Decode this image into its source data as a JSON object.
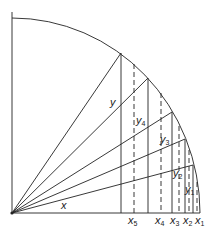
{
  "diagram": {
    "labels": {
      "x": "x",
      "y": "y",
      "y4": "y",
      "y4_sub": "4",
      "y3": "y",
      "y3_sub": "3",
      "y2": "y",
      "y2_sub": "2",
      "y1": "y",
      "y1_sub": "1",
      "x5": "x",
      "x5_sub": "5",
      "x4": "x",
      "x4_sub": "4",
      "x3": "x",
      "x3_sub": "3",
      "x2": "x",
      "x2_sub": "2",
      "x1": "x",
      "x1_sub": "1"
    },
    "colors": {
      "stroke": "#222222",
      "background": "#ffffff"
    }
  }
}
